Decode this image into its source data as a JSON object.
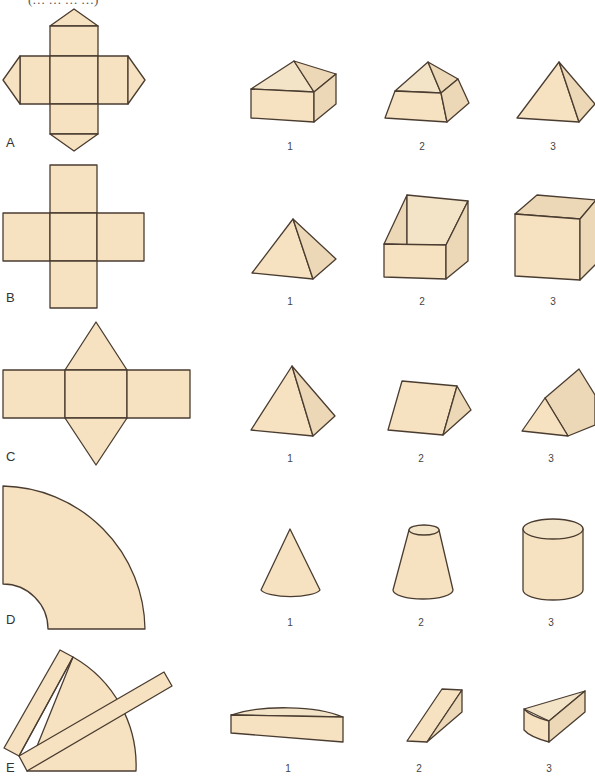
{
  "header": {
    "clipped_text": "(… … … …)"
  },
  "palette": {
    "face": "#f6e2c0",
    "side": "#ecd8b6",
    "edge": "#4a3c30"
  },
  "rows": [
    {
      "label": "A",
      "net": "square with four triangles",
      "options": [
        "1",
        "2",
        "3"
      ],
      "option_shapes": [
        "box with pyramid roof",
        "frustum with pyramid top",
        "square pyramid"
      ]
    },
    {
      "label": "B",
      "net": "cross of five squares",
      "options": [
        "1",
        "2",
        "3"
      ],
      "option_shapes": [
        "square pyramid",
        "open slanted box",
        "open cube"
      ]
    },
    {
      "label": "C",
      "net": "three rectangles with two triangles",
      "options": [
        "1",
        "2",
        "3"
      ],
      "option_shapes": [
        "square pyramid",
        "triangular prism",
        "triangular prism (tilted)"
      ]
    },
    {
      "label": "D",
      "net": "annular sector",
      "options": [
        "1",
        "2",
        "3"
      ],
      "option_shapes": [
        "cone",
        "truncated cone",
        "cylinder"
      ]
    },
    {
      "label": "E",
      "net": "sector with strips",
      "options": [
        "1",
        "2",
        "3"
      ],
      "option_shapes": [
        "half-disc slab",
        "wedge",
        "sector wedge"
      ]
    }
  ]
}
